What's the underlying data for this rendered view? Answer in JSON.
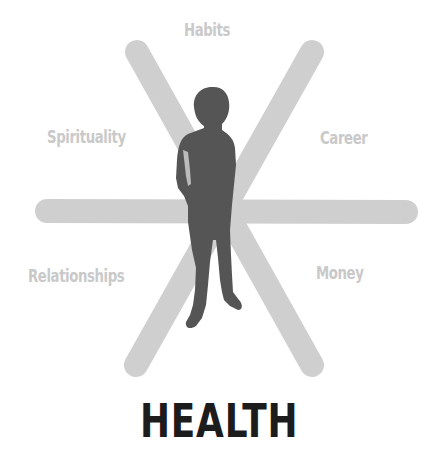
{
  "diagram": {
    "title": "HEALTH",
    "center_figure": "standing-person-silhouette",
    "labels": {
      "top": "Habits",
      "upper_left": "Spirituality",
      "upper_right": "Career",
      "lower_left": "Relationships",
      "lower_right": "Money"
    },
    "colors": {
      "spoke": "#cfcfcf",
      "label": "#c9c9c9",
      "figure": "#555555",
      "title": "#1c1c1c",
      "background": "#ffffff"
    }
  }
}
